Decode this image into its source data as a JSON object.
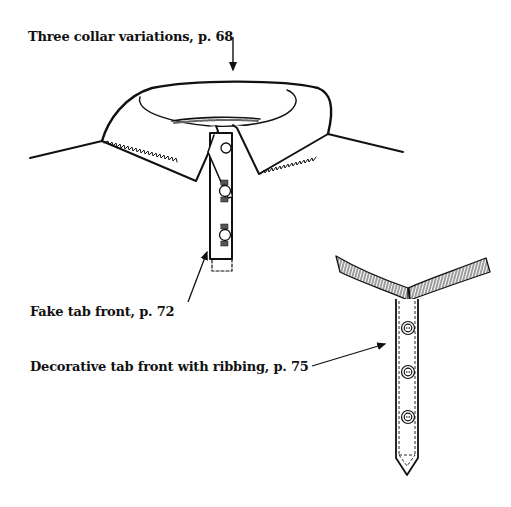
{
  "figure": {
    "type": "sewing illustration",
    "callouts": [
      {
        "id": "collar",
        "text": "Three collar variations, p. 68"
      },
      {
        "id": "fake-tab",
        "text": "Fake tab front, p. 72"
      },
      {
        "id": "decorative-tab",
        "text": "Decorative tab front with ribbing, p. 75"
      }
    ],
    "colors": {
      "ink": "#111111",
      "background": "#ffffff"
    }
  }
}
